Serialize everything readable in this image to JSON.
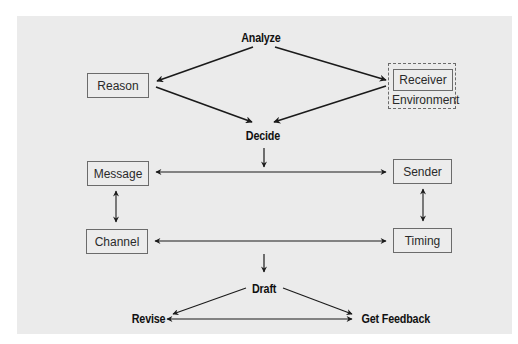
{
  "diagram": {
    "colors": {
      "panel_background": "#ebebeb",
      "box_border": "#6b6b6b",
      "arrow": "#1a1a1a",
      "text": "#2a2a2a"
    },
    "steps": {
      "analyze": "Analyze",
      "decide": "Decide",
      "draft": "Draft",
      "revise": "Revise",
      "get_feedback": "Get Feedback"
    },
    "factors": {
      "reason": "Reason",
      "receiver": "Receiver",
      "environment": "Environment",
      "message": "Message",
      "sender": "Sender",
      "channel": "Channel",
      "timing": "Timing"
    },
    "connections": [
      {
        "from": "Analyze",
        "to": "Reason"
      },
      {
        "from": "Analyze",
        "to": "Receiver"
      },
      {
        "from": "Reason",
        "to": "Decide"
      },
      {
        "from": "Receiver",
        "to": "Decide"
      },
      {
        "from": "Decide",
        "to": "Message/Sender row"
      },
      {
        "from": "Message",
        "to": "Sender",
        "bidirectional": true
      },
      {
        "from": "Message",
        "to": "Channel",
        "bidirectional": true
      },
      {
        "from": "Sender",
        "to": "Timing",
        "bidirectional": true
      },
      {
        "from": "Channel",
        "to": "Timing",
        "bidirectional": true
      },
      {
        "from": "Channel/Timing row",
        "to": "Draft"
      },
      {
        "from": "Draft",
        "to": "Revise"
      },
      {
        "from": "Draft",
        "to": "Get Feedback"
      },
      {
        "from": "Revise",
        "to": "Get Feedback",
        "bidirectional": true
      }
    ]
  }
}
